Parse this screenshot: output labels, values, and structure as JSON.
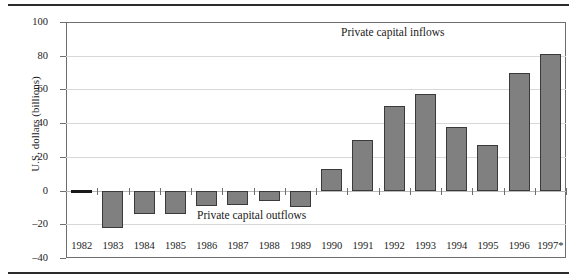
{
  "chart_data": {
    "type": "bar",
    "title": "",
    "xlabel": "",
    "ylabel": "U.S. dollars (billions)",
    "ylim": [
      -40,
      100
    ],
    "yticks": [
      100,
      80,
      60,
      40,
      20,
      0,
      -20,
      -40
    ],
    "ytick_labels": [
      "100",
      "80",
      "60",
      "40",
      "20",
      "0",
      "–20",
      "–40"
    ],
    "grid": true,
    "legend_position": "none",
    "categories": [
      "1982",
      "1983",
      "1984",
      "1985",
      "1986",
      "1987",
      "1988",
      "1989",
      "1990",
      "1991",
      "1992",
      "1993",
      "1994",
      "1995",
      "1996",
      "1997*"
    ],
    "values": [
      0,
      -22,
      -14,
      -14,
      -9,
      -8.5,
      -6,
      -10,
      13,
      30,
      50,
      57,
      38,
      27,
      70,
      81
    ],
    "annotations": [
      {
        "text": "Private capital inflows",
        "x": "1993",
        "y": 92
      },
      {
        "text": "Private capital outflows",
        "x": "1987",
        "y": -14
      }
    ]
  },
  "axis": {
    "y_title": "U.S. dollars (billions)"
  },
  "colors": {
    "bar_fill": "#808080",
    "bar_stroke": "#3a3a3a",
    "grid": "#d8d8d8",
    "frame": "#6e6e6e",
    "rule": "#2b2b2b",
    "text": "#1a1a1a"
  }
}
